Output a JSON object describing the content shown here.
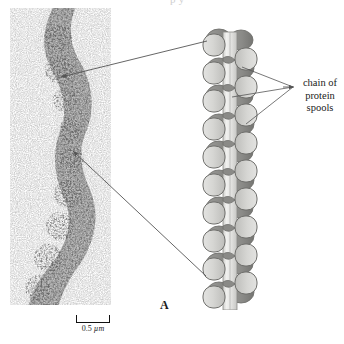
{
  "figure": {
    "panel_letter": "A",
    "top_caption_fragment": "p y"
  },
  "micrograph": {
    "name": "electron-micrograph-chromatin-fiber",
    "scale_bar": {
      "value": "0.5",
      "unit": "µm",
      "full_label": "0.5 µm"
    }
  },
  "callout": {
    "line1": "chain of",
    "line2": "protein",
    "line3": "spools"
  },
  "diagram": {
    "name": "solenoid-chromatin-model",
    "units": 10,
    "colors": {
      "spool_light": "#d8d8d6",
      "spool_light_shade": "#c2c2bf",
      "spool_dark": "#8f8f8c",
      "spool_dark_shade": "#7a7a77",
      "outline": "#6f6f6c",
      "core_column": "#e6e6e4",
      "background": "#ffffff"
    }
  },
  "style": {
    "line_color": "#555555",
    "text_color": "#1a1a1a",
    "page_background": "#ffffff"
  }
}
